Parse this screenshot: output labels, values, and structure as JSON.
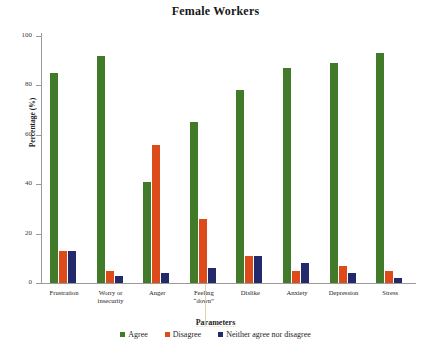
{
  "chart_data": {
    "type": "bar",
    "title": "Female Workers",
    "xlabel": "Parameters",
    "ylabel": "Percentage (%)",
    "ylim": [
      0,
      100
    ],
    "yticks": [
      0,
      20,
      40,
      60,
      80,
      100
    ],
    "grid": false,
    "legend_position": "bottom",
    "categories": [
      "Frustration",
      "Worry or\ninsecurity",
      "Anger",
      "Feeling\n“down”",
      "Dislike",
      "Anxiety",
      "Depression",
      "Stress"
    ],
    "series": [
      {
        "name": "Agree",
        "color": "#417A29",
        "values": [
          85,
          92,
          41,
          65,
          78,
          87,
          89,
          93
        ]
      },
      {
        "name": "Disagree",
        "color": "#DD4B1A",
        "values": [
          13,
          5,
          56,
          26,
          11,
          5,
          7,
          5
        ]
      },
      {
        "name": "Neither agree nor disagree",
        "color": "#232A6B",
        "values": [
          13,
          3,
          4,
          6,
          11,
          8,
          4,
          2
        ]
      }
    ]
  },
  "colors": {
    "agree": "#417A29",
    "disagree": "#DD4B1A",
    "neither": "#232A6B",
    "axis": "#9a9a9a",
    "text": "#1a1a1a",
    "background": "#ffffff"
  }
}
